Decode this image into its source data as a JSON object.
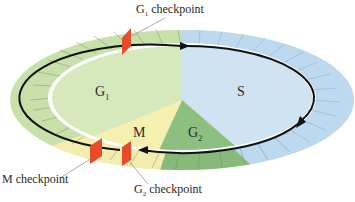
{
  "diagram": {
    "phases": [
      {
        "id": "G1",
        "base": "G",
        "sub": "1",
        "color": "#d6e8bc"
      },
      {
        "id": "S",
        "base": "S",
        "sub": "",
        "color": "#cfe3f3"
      },
      {
        "id": "G2",
        "base": "G",
        "sub": "2",
        "color": "#8cbf80"
      },
      {
        "id": "M",
        "base": "M",
        "sub": "",
        "color": "#f4f0b0"
      }
    ],
    "checkpoints": [
      {
        "id": "g1",
        "base": "G",
        "sub": "1",
        "suffix": " checkpoint"
      },
      {
        "id": "m",
        "base": "M",
        "sub": "",
        "suffix": " checkpoint"
      },
      {
        "id": "g2",
        "base": "G",
        "sub": "2",
        "suffix": " checkpoint"
      }
    ],
    "colors": {
      "checkpoint_marker": "#e84a2a",
      "ring_g1": "#c8e0aa",
      "ring_s": "#bcd9ef",
      "ring_g2": "#86b97a",
      "ring_m": "#f3eeb0",
      "arrow": "#111111"
    }
  }
}
